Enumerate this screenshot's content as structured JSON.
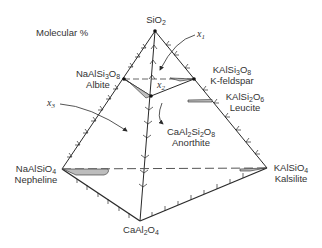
{
  "title": "Molecular %",
  "vertices": {
    "silica": {
      "formula_main": "SiO",
      "formula_sub": "2",
      "name": ""
    },
    "albite": {
      "formula": [
        "NaAlSi",
        "3",
        "O",
        "8"
      ],
      "name": "Albite"
    },
    "kfeldspar": {
      "formula": [
        "KAlSi",
        "3",
        "O",
        "8"
      ],
      "name": "K-feldspar"
    },
    "leucite": {
      "formula": [
        "KAlSi",
        "2",
        "O",
        "6"
      ],
      "name": "Leucite"
    },
    "anorthite": {
      "formula": [
        "CaAl",
        "2",
        "Si",
        "2",
        "O",
        "8"
      ],
      "name": "Anorthite"
    },
    "nepheline": {
      "formula": [
        "NaAlSiO",
        "4"
      ],
      "name": "Nepheline"
    },
    "kalsilite": {
      "formula": [
        "KAlSiO",
        "4"
      ],
      "name": "Kalsilite"
    },
    "calcium_aluminate": {
      "formula": [
        "CaAl",
        "2",
        "O",
        "4"
      ],
      "name": ""
    }
  },
  "points": {
    "x1": {
      "var": "x",
      "sub": "1"
    },
    "x2": {
      "var": "x",
      "sub": "2"
    },
    "x3": {
      "var": "x",
      "sub": "3"
    }
  },
  "colors": {
    "line": "#2a2a2a",
    "shade": "#bdbdbd",
    "dash": "#555555"
  }
}
